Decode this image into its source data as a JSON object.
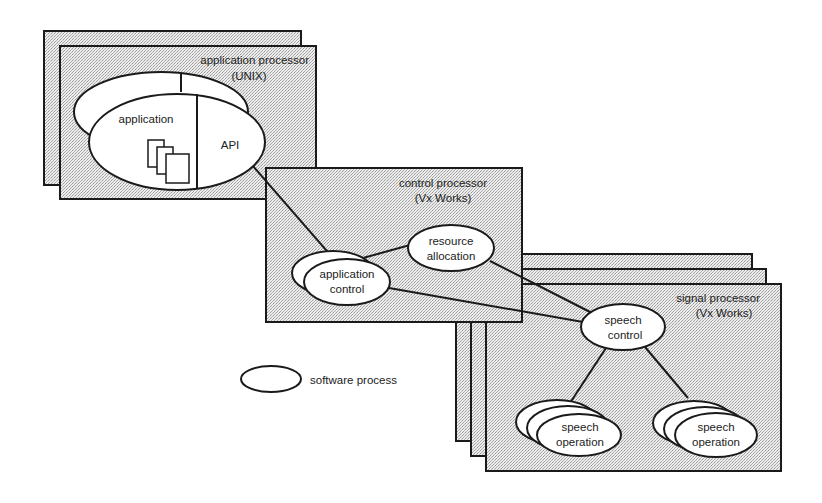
{
  "diagram": {
    "title": "",
    "colors": {
      "background": "#ffffff",
      "box_fill": "#e2e2e2",
      "stroke": "#1a1a1a",
      "ellipse_fill": "#ffffff",
      "text": "#222222"
    },
    "application_processor": {
      "label_line1": "application processor",
      "label_line2": "(UNIX)",
      "process_application": "application",
      "process_api": "API"
    },
    "control_processor": {
      "label_line1": "control processor",
      "label_line2": "(Vx Works)",
      "process_application_control_line1": "application",
      "process_application_control_line2": "control",
      "process_resource_allocation_line1": "resource",
      "process_resource_allocation_line2": "allocation"
    },
    "signal_processor": {
      "label_line1": "signal processor",
      "label_line2": "(Vx Works)",
      "process_speech_control_line1": "speech",
      "process_speech_control_line2": "control",
      "speech_operation_left_line1": "speech",
      "speech_operation_left_line2": "operation",
      "speech_operation_right_line1": "speech",
      "speech_operation_right_line2": "operation"
    },
    "legend": {
      "software_process_label": "software process"
    },
    "connections": [
      {
        "from": "API",
        "to": "application control"
      },
      {
        "from": "application control",
        "to": "resource allocation"
      },
      {
        "from": "resource allocation",
        "to": "speech control"
      },
      {
        "from": "application control",
        "to": "speech control"
      },
      {
        "from": "speech control",
        "to": "speech operation (left)"
      },
      {
        "from": "speech control",
        "to": "speech operation (right)"
      }
    ]
  }
}
